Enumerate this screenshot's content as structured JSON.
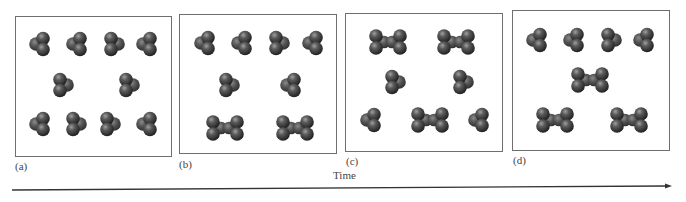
{
  "figure": {
    "axis_label": "Time",
    "colors": {
      "atom_dark": "#2a2a2a",
      "atom_mid": "#5a5a5a",
      "atom_light": "#a0a0a0",
      "frame": "#6f6f6f",
      "arrow": "#333333"
    },
    "panels": [
      {
        "label": "(a)",
        "box": {
          "x": 15,
          "y": 16,
          "w": 157,
          "h": 141
        },
        "label_pos": {
          "x": 15,
          "y": 170
        },
        "molecules": [
          {
            "type": "trimer",
            "x": 41,
            "y": 44,
            "variant": "L"
          },
          {
            "type": "trimer",
            "x": 78,
            "y": 44,
            "variant": "L"
          },
          {
            "type": "trimer",
            "x": 113,
            "y": 44,
            "variant": "R"
          },
          {
            "type": "trimer",
            "x": 148,
            "y": 44,
            "variant": "L"
          },
          {
            "type": "trimer",
            "x": 62,
            "y": 85,
            "variant": "R"
          },
          {
            "type": "trimer",
            "x": 128,
            "y": 85,
            "variant": "R"
          },
          {
            "type": "trimer",
            "x": 41,
            "y": 124,
            "variant": "L"
          },
          {
            "type": "trimer",
            "x": 75,
            "y": 124,
            "variant": "R"
          },
          {
            "type": "trimer",
            "x": 109,
            "y": 124,
            "variant": "R"
          },
          {
            "type": "trimer",
            "x": 148,
            "y": 124,
            "variant": "L"
          }
        ],
        "counts": {
          "trimers": 10,
          "dimers": 0
        }
      },
      {
        "label": "(b)",
        "box": {
          "x": 179,
          "y": 14,
          "w": 158,
          "h": 140
        },
        "label_pos": {
          "x": 179,
          "y": 168
        },
        "molecules": [
          {
            "type": "trimer",
            "x": 206,
            "y": 43,
            "variant": "L"
          },
          {
            "type": "trimer",
            "x": 243,
            "y": 43,
            "variant": "L"
          },
          {
            "type": "trimer",
            "x": 278,
            "y": 43,
            "variant": "R"
          },
          {
            "type": "trimer",
            "x": 314,
            "y": 43,
            "variant": "L"
          },
          {
            "type": "trimer",
            "x": 228,
            "y": 85,
            "variant": "R"
          },
          {
            "type": "trimer",
            "x": 292,
            "y": 85,
            "variant": "L"
          },
          {
            "type": "dimer",
            "x": 225,
            "y": 128
          },
          {
            "type": "dimer",
            "x": 295,
            "y": 128
          }
        ],
        "counts": {
          "trimers": 6,
          "dimers": 2
        }
      },
      {
        "label": "(c)",
        "box": {
          "x": 345,
          "y": 13,
          "w": 158,
          "h": 139
        },
        "label_pos": {
          "x": 346,
          "y": 165
        },
        "molecules": [
          {
            "type": "dimer",
            "x": 388,
            "y": 42
          },
          {
            "type": "dimer",
            "x": 456,
            "y": 42
          },
          {
            "type": "trimer",
            "x": 394,
            "y": 82,
            "variant": "R"
          },
          {
            "type": "trimer",
            "x": 462,
            "y": 82,
            "variant": "R"
          },
          {
            "type": "trimer",
            "x": 372,
            "y": 120,
            "variant": "L"
          },
          {
            "type": "dimer",
            "x": 430,
            "y": 120
          },
          {
            "type": "trimer",
            "x": 480,
            "y": 120,
            "variant": "L"
          }
        ],
        "counts": {
          "trimers": 4,
          "dimers": 3
        }
      },
      {
        "label": "(d)",
        "box": {
          "x": 512,
          "y": 10,
          "w": 158,
          "h": 141
        },
        "label_pos": {
          "x": 513,
          "y": 164
        },
        "molecules": [
          {
            "type": "trimer",
            "x": 538,
            "y": 40,
            "variant": "L"
          },
          {
            "type": "trimer",
            "x": 575,
            "y": 40,
            "variant": "L"
          },
          {
            "type": "trimer",
            "x": 610,
            "y": 40,
            "variant": "R"
          },
          {
            "type": "trimer",
            "x": 645,
            "y": 40,
            "variant": "L"
          },
          {
            "type": "dimer",
            "x": 590,
            "y": 80
          },
          {
            "type": "dimer",
            "x": 555,
            "y": 120
          },
          {
            "type": "dimer",
            "x": 629,
            "y": 120
          }
        ],
        "counts": {
          "trimers": 4,
          "dimers": 3
        }
      }
    ],
    "time_arrow": {
      "x1": 12,
      "y1": 190,
      "x2": 672,
      "y2": 186,
      "label_x": 333,
      "label_y": 180
    }
  }
}
